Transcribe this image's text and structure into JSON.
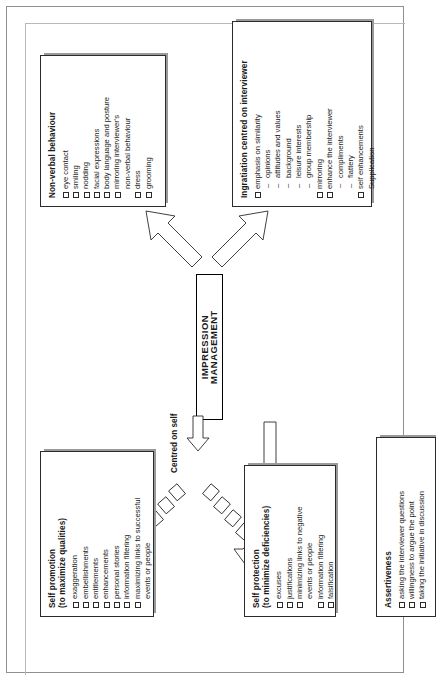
{
  "diagram": {
    "title": "IMPRESSION MANAGEMENT",
    "branch_label_self": "Centred on self"
  },
  "nodes": {
    "self_promotion": {
      "title": "Self promotion\n(to maximize qualities)",
      "items": [
        {
          "marker": "checkbox",
          "text": "exaggeration"
        },
        {
          "marker": "checkbox",
          "text": "embellishments"
        },
        {
          "marker": "checkbox",
          "text": "entitlements"
        },
        {
          "marker": "checkbox",
          "text": "enhancements"
        },
        {
          "marker": "checkbox",
          "text": "personal stories"
        },
        {
          "marker": "checkbox",
          "text": "information filtering"
        },
        {
          "marker": "checkbox",
          "text": "maximizing links to successful"
        },
        {
          "marker": "none",
          "text": "events or people"
        }
      ]
    },
    "non_verbal": {
      "title": "Non-verbal behaviour",
      "items": [
        {
          "marker": "checkbox",
          "text": "eye contact"
        },
        {
          "marker": "checkbox",
          "text": "smiling"
        },
        {
          "marker": "checkbox",
          "text": "nodding"
        },
        {
          "marker": "checkbox",
          "text": "facial expressions"
        },
        {
          "marker": "checkbox",
          "text": "body language and posture"
        },
        {
          "marker": "checkbox",
          "text": "mirroring interviewer's"
        },
        {
          "marker": "none",
          "text": "non-verbal behaviour"
        },
        {
          "marker": "checkbox",
          "text": "dress"
        },
        {
          "marker": "checkbox",
          "text": "grooming"
        }
      ]
    },
    "self_protection": {
      "title": "Self protection\n(to minimize deficiencies)",
      "items": [
        {
          "marker": "checkbox",
          "text": "excuses"
        },
        {
          "marker": "checkbox",
          "text": "justifications"
        },
        {
          "marker": "checkbox",
          "text": "minimizing links to negative"
        },
        {
          "marker": "none",
          "text": "events or people"
        },
        {
          "marker": "checkbox",
          "text": "information filtering"
        },
        {
          "marker": "checkbox",
          "text": "falsification"
        }
      ]
    },
    "ingratiation": {
      "title": "Ingratiation centred on interviewer",
      "items": [
        {
          "marker": "checkbox",
          "text": "emphasis on similarity"
        },
        {
          "marker": "dash",
          "text": "opinions"
        },
        {
          "marker": "dash",
          "text": "attitudes and values"
        },
        {
          "marker": "dash",
          "text": "background"
        },
        {
          "marker": "dash",
          "text": "leisure interests"
        },
        {
          "marker": "dash",
          "text": "group membership"
        },
        {
          "marker": "checkbox",
          "text": "mirroring"
        },
        {
          "marker": "checkbox",
          "text": "enhance the interviewer"
        },
        {
          "marker": "dash",
          "text": "compliments"
        },
        {
          "marker": "dash",
          "text": "flattery"
        },
        {
          "marker": "checkbox",
          "text": "self enhancements"
        },
        {
          "marker": "none",
          "text": "Supplication"
        }
      ]
    },
    "assertiveness": {
      "title": "Assertiveness",
      "items": [
        {
          "marker": "checkbox",
          "text": "asking the interviewer questions"
        },
        {
          "marker": "checkbox",
          "text": "willingness to argue the point"
        },
        {
          "marker": "checkbox",
          "text": "taking the initiative in discussion"
        }
      ]
    }
  },
  "colors": {
    "ink": "#2b2b2b",
    "paper": "#ffffff",
    "frame": "#8f8f8f",
    "shadow": "#9a9a9a"
  }
}
